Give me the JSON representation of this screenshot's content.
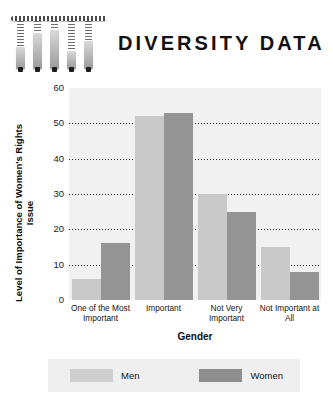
{
  "header": {
    "title": "DIVERSITY DATA",
    "logo_icon": "hanging-bars-logo"
  },
  "chart_data": {
    "type": "bar",
    "title": "DIVERSITY DATA",
    "xlabel": "Gender",
    "ylabel": "Level of Importance of Women's Rights Issue",
    "categories": [
      "One of the Most Important",
      "Important",
      "Not Very Important",
      "Not Important at All"
    ],
    "series": [
      {
        "name": "Men",
        "color": "#c9c9c9",
        "values": [
          6,
          52,
          30,
          15
        ]
      },
      {
        "name": "Women",
        "color": "#949494",
        "values": [
          16,
          53,
          25,
          8
        ]
      }
    ],
    "ylim": [
      0,
      60
    ],
    "yticks": [
      60,
      50,
      40,
      30,
      20,
      10,
      0
    ],
    "grid": true,
    "legend_position": "bottom",
    "plot_background": "#f1f1f1"
  }
}
